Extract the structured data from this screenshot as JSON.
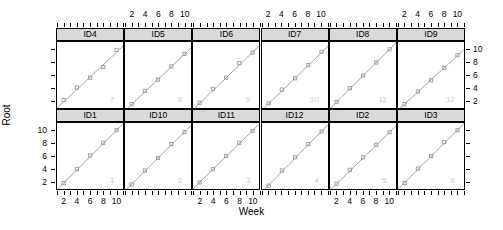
{
  "figure": {
    "xlabel": "Week",
    "ylabel": "Root",
    "panel_cols": 6,
    "panel_rows": 2,
    "strip_bg": "#d9d9d9",
    "point_color": "#9a9a9a",
    "line_color": "#9a9a9a",
    "watermark_color": "#c9c9c9"
  },
  "axes": {
    "x_ticks": [
      2,
      4,
      6,
      8,
      10
    ],
    "x_tick_labels": [
      "2",
      "4",
      "6",
      "8",
      "10"
    ],
    "x_minor_ticks": [
      1,
      2,
      3,
      4,
      5,
      6,
      7,
      8,
      9,
      10,
      11
    ],
    "xlim": [
      1,
      11
    ],
    "y_ticks": [
      2,
      4,
      6,
      8,
      10
    ],
    "y_tick_labels_bottom_left": [
      "10",
      "8",
      "6",
      "4",
      "2"
    ],
    "y_tick_labels_top_right": [
      "10",
      "8",
      "6",
      "4",
      "2"
    ],
    "ylim": [
      1,
      11
    ],
    "top_labeled_panels": [
      1,
      3,
      5
    ],
    "bottom_labeled_panels": [
      0,
      2,
      4
    ],
    "left_labeled_row": 1,
    "right_labeled_row": 0
  },
  "chart_data": {
    "type": "scatter",
    "title": "",
    "xlabel": "Week",
    "ylabel": "Root",
    "xlim": [
      1,
      11
    ],
    "ylim": [
      1,
      11
    ],
    "grid": false,
    "legend": "none",
    "layout": "trellis 2 rows x 6 columns",
    "panels": [
      {
        "label": "ID4",
        "index": 7,
        "row": 0,
        "col": 0,
        "x": [
          2,
          4,
          6,
          8,
          10
        ],
        "y": [
          2.2,
          4.1,
          5.6,
          7.2,
          9.8
        ],
        "fit": {
          "intercept": 0.05,
          "slope": 0.94
        }
      },
      {
        "label": "ID5",
        "index": 8,
        "row": 0,
        "col": 1,
        "x": [
          2,
          4,
          6,
          8,
          10
        ],
        "y": [
          1.6,
          3.6,
          5.3,
          7.3,
          9.2
        ],
        "fit": {
          "intercept": -0.35,
          "slope": 0.95
        }
      },
      {
        "label": "ID6",
        "index": 9,
        "row": 0,
        "col": 2,
        "x": [
          2,
          4,
          6,
          8,
          10
        ],
        "y": [
          1.8,
          3.9,
          5.6,
          7.8,
          9.4
        ],
        "fit": {
          "intercept": -0.25,
          "slope": 0.97
        }
      },
      {
        "label": "ID7",
        "index": 10,
        "row": 0,
        "col": 3,
        "x": [
          2,
          4,
          6,
          8,
          10
        ],
        "y": [
          1.7,
          3.8,
          5.5,
          7.5,
          9.5
        ],
        "fit": {
          "intercept": -0.3,
          "slope": 0.97
        }
      },
      {
        "label": "ID8",
        "index": 11,
        "row": 0,
        "col": 4,
        "x": [
          2,
          4,
          6,
          8,
          10
        ],
        "y": [
          1.9,
          4.0,
          5.9,
          7.9,
          9.9
        ],
        "fit": {
          "intercept": -0.1,
          "slope": 1.0
        }
      },
      {
        "label": "ID9",
        "index": 12,
        "row": 0,
        "col": 5,
        "x": [
          2,
          4,
          6,
          8,
          10
        ],
        "y": [
          1.6,
          3.5,
          5.2,
          7.1,
          9.0
        ],
        "fit": {
          "intercept": -0.25,
          "slope": 0.92
        }
      },
      {
        "label": "ID1",
        "index": 1,
        "row": 1,
        "col": 0,
        "x": [
          2,
          4,
          6,
          8,
          10
        ],
        "y": [
          1.9,
          4.0,
          6.1,
          8.0,
          9.9
        ],
        "fit": {
          "intercept": -0.1,
          "slope": 1.0
        }
      },
      {
        "label": "ID10",
        "index": 2,
        "row": 1,
        "col": 1,
        "x": [
          2,
          4,
          6,
          8,
          10
        ],
        "y": [
          1.7,
          3.8,
          5.7,
          7.8,
          9.6
        ],
        "fit": {
          "intercept": -0.25,
          "slope": 0.99
        }
      },
      {
        "label": "ID11",
        "index": 3,
        "row": 1,
        "col": 2,
        "x": [
          2,
          4,
          6,
          8,
          10
        ],
        "y": [
          2.0,
          4.0,
          6.0,
          8.0,
          9.8
        ],
        "fit": {
          "intercept": 0.05,
          "slope": 0.98
        }
      },
      {
        "label": "ID12",
        "index": 4,
        "row": 1,
        "col": 3,
        "x": [
          2,
          4,
          6,
          8,
          10
        ],
        "y": [
          1.5,
          3.8,
          5.8,
          7.8,
          9.7
        ],
        "fit": {
          "intercept": -0.45,
          "slope": 1.02
        }
      },
      {
        "label": "ID2",
        "index": 5,
        "row": 1,
        "col": 4,
        "x": [
          2,
          4,
          6,
          8,
          10
        ],
        "y": [
          1.8,
          3.9,
          5.8,
          7.7,
          9.6
        ],
        "fit": {
          "intercept": -0.2,
          "slope": 0.98
        }
      },
      {
        "label": "ID3",
        "index": 6,
        "row": 1,
        "col": 5,
        "x": [
          2,
          4,
          6,
          8,
          10
        ],
        "y": [
          1.9,
          4.1,
          6.0,
          8.1,
          9.9
        ],
        "fit": {
          "intercept": -0.05,
          "slope": 1.0
        }
      }
    ]
  }
}
